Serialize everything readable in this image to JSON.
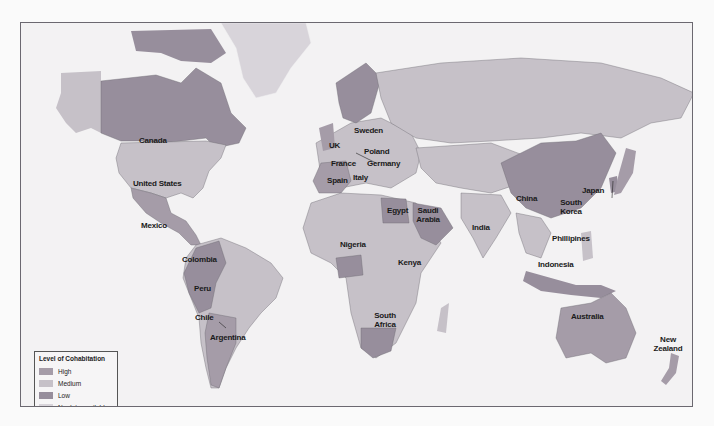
{
  "map": {
    "colors": {
      "ocean": "#f3f2f3",
      "page": "#fafafa",
      "high": "#a59ca8",
      "medium": "#c6c1c8",
      "low": "#978e9c",
      "no_data": "#d8d4da",
      "border": "#6b6870"
    },
    "labels": {
      "canada": "Canada",
      "united_states": "United States",
      "mexico": "Mexico",
      "colombia": "Colombia",
      "peru": "Peru",
      "chile": "Chile",
      "argentina": "Argentina",
      "uk": "UK",
      "sweden": "Sweden",
      "poland": "Poland",
      "france": "France",
      "germany": "Germany",
      "spain": "Spain",
      "italy": "Italy",
      "egypt": "Egypt",
      "saudi_arabia": "Saudi Arabia",
      "nigeria": "Nigeria",
      "kenya": "Kenya",
      "south_africa": "South Africa",
      "india": "India",
      "china": "China",
      "japan": "Japan",
      "south_korea": "South Korea",
      "phillipines": "Phillipines",
      "indonesia": "Indonesia",
      "australia": "Australia",
      "new_zealand": "New Zealand"
    }
  },
  "legend": {
    "title": "Level of Cohabitation",
    "items": [
      {
        "label": "High",
        "color": "#a59ca8"
      },
      {
        "label": "Medium",
        "color": "#c6c1c8"
      },
      {
        "label": "Low",
        "color": "#978e9c"
      },
      {
        "label": "No data available",
        "color": "#d8d4da"
      }
    ]
  }
}
